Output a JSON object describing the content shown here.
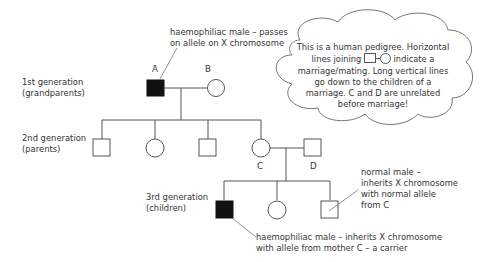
{
  "generations": [
    {
      "label_line1": "1st generation",
      "label_line2": "(grandparents)"
    },
    {
      "label_line1": "2nd generation",
      "label_line2": "(parents)"
    },
    {
      "label_line1": "3rd generation",
      "label_line2": "(children)"
    }
  ],
  "individuals": {
    "A": "A",
    "B": "B",
    "C": "C",
    "D": "D"
  },
  "annotations": {
    "grandfather_line1": "haemophiliac male – passes",
    "grandfather_line2": "on allele on X chromosome",
    "normal_son_line1": "normal male –",
    "normal_son_line2": "inherits X chromosome",
    "normal_son_line3": "with normal allele",
    "normal_son_line4": "from C",
    "affected_son_line1": "haemophiliac male – inherits X chromosome",
    "affected_son_line2": "with allele from mother C – a carrier"
  },
  "cloud": {
    "line1": "This is a human pedigree. Horizontal",
    "line2_a": "lines joining",
    "line2_b": "indicate a",
    "line3": "marriage/mating. Long vertical lines",
    "line4": "go down to the children of a",
    "line5": "marriage. C and D are unrelated",
    "line6": "before marriage!"
  },
  "colors": {
    "affected": "#111111",
    "line": "#555555"
  }
}
